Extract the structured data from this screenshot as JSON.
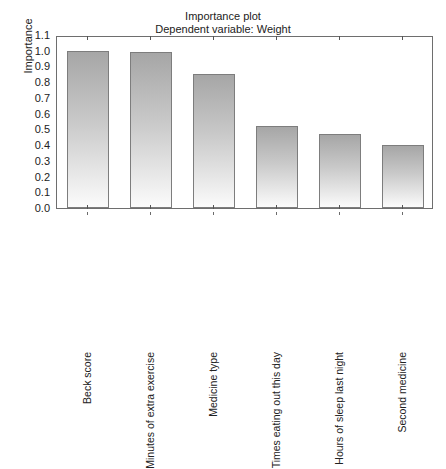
{
  "chart_data": {
    "type": "bar",
    "title": "Importance plot",
    "subtitle": "Dependent variable: Weight",
    "xlabel": "",
    "ylabel": "Importance",
    "ylim": [
      0.0,
      1.1
    ],
    "grid": false,
    "legend": "none",
    "categories": [
      "Beck score",
      "Minutes of extra exercise",
      "Medicine type",
      "Times eating out this day",
      "Hours of sleep last night",
      "Second medicine"
    ],
    "values": [
      1.0,
      0.99,
      0.855,
      0.52,
      0.47,
      0.4
    ],
    "ytick_labels": [
      "1.1",
      "1.0",
      "0.9",
      "0.8",
      "0.7",
      "0.6",
      "0.5",
      "0.4",
      "0.3",
      "0.2",
      "0.1",
      "0.0"
    ],
    "ytick_values": [
      1.1,
      1.0,
      0.9,
      0.8,
      0.7,
      0.6,
      0.5,
      0.4,
      0.3,
      0.2,
      0.1,
      0.0
    ],
    "bar_color_top": "#a6a6a6",
    "bar_color_bottom": "#fbfbfb",
    "bar_border_color": "#7d7d7d",
    "axis_color": "#6e6e6e"
  }
}
